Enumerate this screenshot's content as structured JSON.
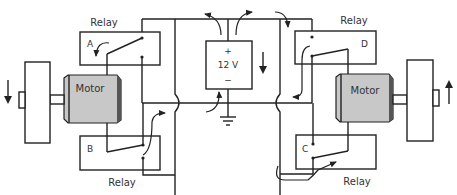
{
  "diagram": {
    "type": "relay-motor-circuit",
    "battery": {
      "plus": "+",
      "voltage": "12 V",
      "minus": "−"
    },
    "relays": [
      {
        "id": "A",
        "caption": "Relay",
        "letter": "A"
      },
      {
        "id": "B",
        "caption": "Relay",
        "letter": "B"
      },
      {
        "id": "C",
        "caption": "Relay",
        "letter": "C"
      },
      {
        "id": "D",
        "caption": "Relay",
        "letter": "D"
      }
    ],
    "motors": [
      {
        "id": "left",
        "label": "Motor",
        "rotation": "down"
      },
      {
        "id": "right",
        "label": "Motor",
        "rotation": "up"
      }
    ],
    "colors": {
      "line": "#222222",
      "motor_body": "#c8c8c8",
      "motor_end": "#555555",
      "background": "#ffffff"
    }
  }
}
